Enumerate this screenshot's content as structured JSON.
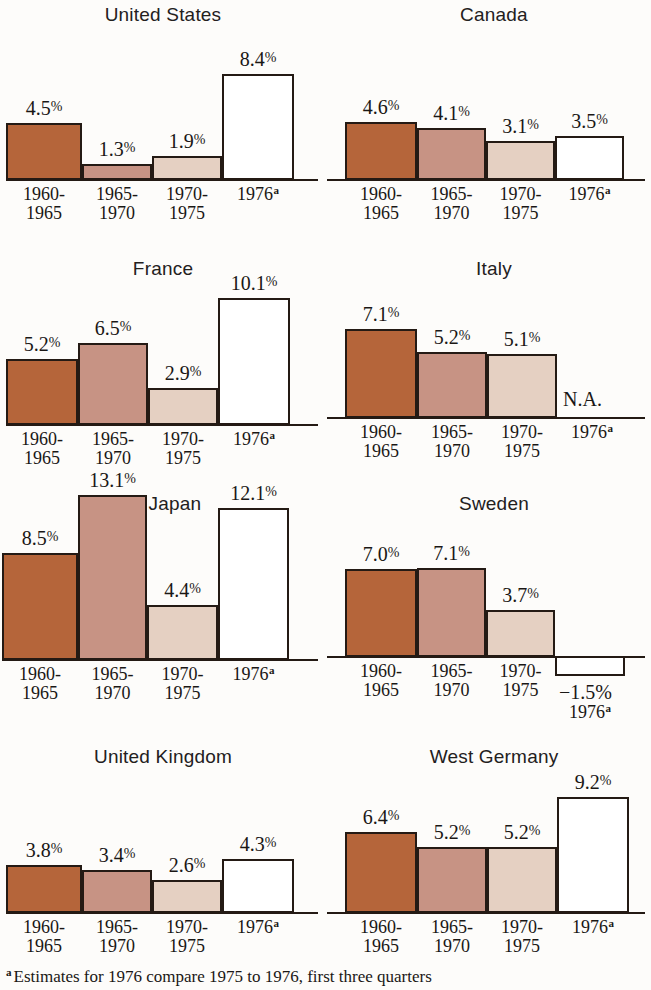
{
  "figure": {
    "footnote_marker": "a",
    "footnote_text": "Estimates for 1976 compare 1975 to 1976, first three quarters",
    "period_labels": [
      {
        "line1": "1960-",
        "line2": "1965"
      },
      {
        "line1": "1965-",
        "line2": "1970"
      },
      {
        "line1": "1970-",
        "line2": "1975"
      },
      {
        "line1": "1976",
        "line2": ""
      }
    ],
    "colors": {
      "series_1960_1965": "#b5653a",
      "series_1965_1970": "#c79384",
      "series_1970_1975": "#e5d0c2",
      "series_1976": "#ffffff",
      "outline": "#241a14",
      "background": "#fdfcfa",
      "text": "#1a1715"
    }
  },
  "chart_data": {
    "type": "bar",
    "title": "",
    "xlabel": "",
    "ylabel": "",
    "categories": [
      "1960-1965",
      "1965-1970",
      "1970-1975",
      "1976"
    ],
    "series_note": "Each panel is one country; values are annual percent growth rates.",
    "panels": [
      {
        "title": "United States",
        "values": [
          4.5,
          1.3,
          1.9,
          8.4
        ],
        "labels": [
          "4.5",
          "1.3",
          "1.9",
          "8.4"
        ],
        "suffix": "%",
        "na_label": ""
      },
      {
        "title": "Canada",
        "values": [
          4.6,
          4.1,
          3.1,
          3.5
        ],
        "labels": [
          "4.6",
          "4.1",
          "3.1",
          "3.5"
        ],
        "suffix": "%",
        "na_label": ""
      },
      {
        "title": "France",
        "values": [
          5.2,
          6.5,
          2.9,
          10.1
        ],
        "labels": [
          "5.2",
          "6.5",
          "2.9",
          "10.1"
        ],
        "suffix": "%",
        "na_label": ""
      },
      {
        "title": "Italy",
        "values": [
          7.1,
          5.2,
          5.1,
          null
        ],
        "labels": [
          "7.1",
          "5.2",
          "5.1",
          ""
        ],
        "suffix": "%",
        "na_label": "N.A."
      },
      {
        "title": "Japan",
        "values": [
          8.5,
          13.1,
          4.4,
          12.1
        ],
        "labels": [
          "8.5",
          "13.1",
          "4.4",
          "12.1"
        ],
        "suffix": "%",
        "na_label": ""
      },
      {
        "title": "Sweden",
        "values": [
          7.0,
          7.1,
          3.7,
          -1.5
        ],
        "labels": [
          "7.0",
          "7.1",
          "3.7",
          "−1.5"
        ],
        "suffix": "%",
        "na_label": ""
      },
      {
        "title": "United Kingdom",
        "values": [
          3.8,
          3.4,
          2.6,
          4.3
        ],
        "labels": [
          "3.8",
          "3.4",
          "2.6",
          "4.3"
        ],
        "suffix": "%",
        "na_label": ""
      },
      {
        "title": "West Germany",
        "values": [
          6.4,
          5.2,
          5.2,
          9.2
        ],
        "labels": [
          "6.4",
          "5.2",
          "5.2",
          "9.2"
        ],
        "suffix": "%",
        "na_label": ""
      }
    ]
  }
}
